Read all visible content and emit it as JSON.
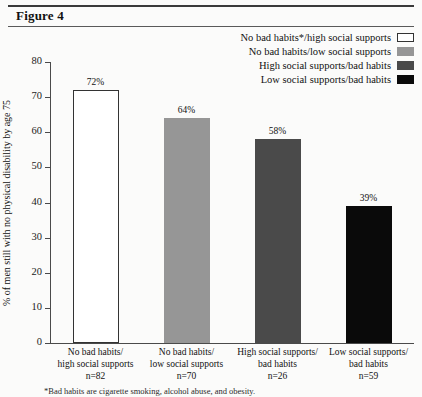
{
  "figure": {
    "title": "Figure 4"
  },
  "chart_data": {
    "type": "bar",
    "title": "Figure 4",
    "xlabel": "",
    "ylabel": "% of men still with no physical disability by age 75",
    "ylim": [
      0,
      80
    ],
    "yticks": [
      0,
      10,
      20,
      30,
      40,
      50,
      60,
      70,
      80
    ],
    "grid": false,
    "legend_position": "top-right",
    "categories": [
      "No bad habits/ high social supports",
      "No bad habits/ low social supports",
      "High social supports/ bad habits",
      "Low social supports/ bad habits"
    ],
    "values": [
      72,
      64,
      58,
      39
    ],
    "value_labels": [
      "72%",
      "64%",
      "58%",
      "39%"
    ],
    "counts": [
      "n=82",
      "n=70",
      "n=26",
      "n=59"
    ],
    "colors": [
      "#ffffff",
      "#969696",
      "#4a4a4a",
      "#0a0a0a"
    ]
  },
  "yaxis": {
    "label": "% of men still with no physical disability by age 75",
    "ticks": [
      {
        "value": 80,
        "text": "80"
      },
      {
        "value": 70,
        "text": "70"
      },
      {
        "value": 60,
        "text": "60"
      },
      {
        "value": 50,
        "text": "50"
      },
      {
        "value": 40,
        "text": "40"
      },
      {
        "value": 30,
        "text": "30"
      },
      {
        "value": 20,
        "text": "20"
      },
      {
        "value": 10,
        "text": "10"
      },
      {
        "value": 0,
        "text": "0"
      }
    ]
  },
  "legend": {
    "items": [
      {
        "label": "No bad habits*/high social supports",
        "color": "#ffffff",
        "border": "#333333"
      },
      {
        "label": "No bad habits/low social supports",
        "color": "#969696",
        "border": "#969696"
      },
      {
        "label": "High social supports/bad habits",
        "color": "#4a4a4a",
        "border": "#4a4a4a"
      },
      {
        "label": "Low social supports/bad habits",
        "color": "#0a0a0a",
        "border": "#0a0a0a"
      }
    ]
  },
  "categories": [
    {
      "line1": "No bad habits/",
      "line2": "high social supports",
      "n": "n=82",
      "value_label": "72%"
    },
    {
      "line1": "No bad habits/",
      "line2": "low social supports",
      "n": "n=70",
      "value_label": "64%"
    },
    {
      "line1": "High social supports/",
      "line2": "bad habits",
      "n": "n=26",
      "value_label": "58%"
    },
    {
      "line1": "Low social supports/",
      "line2": "bad habits",
      "n": "n=59",
      "value_label": "39%"
    }
  ],
  "footnote": {
    "text": "*Bad habits are cigarette smoking, alcohol abuse, and obesity."
  }
}
